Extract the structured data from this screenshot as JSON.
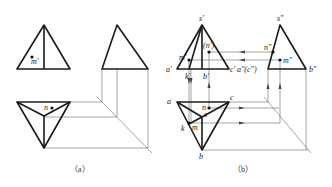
{
  "figure": {
    "panels": [
      {
        "id": "a",
        "caption": "（a）",
        "labels": {
          "m_prime": "m'",
          "n": "n"
        }
      },
      {
        "id": "b",
        "caption": "（b）",
        "labels": {
          "s_prime": "s'",
          "s_double": "s\"",
          "n_prime_hidden": "(n')",
          "m_prime": "m'",
          "a_prime": "a'",
          "k_prime": "k'",
          "b_prime": "b'",
          "c_prime": "c'",
          "a_double_c_double": "a\"(c\")",
          "n_double": "n\"",
          "m_double": "m\"",
          "b_double": "b\"",
          "a": "a",
          "c": "c",
          "n": "n",
          "s": "s",
          "k": "k",
          "m": "m",
          "b": "b"
        }
      }
    ],
    "colors": {
      "line": "#1a1a1a",
      "construction": "#6a6a6a",
      "background": "#ffffff"
    }
  }
}
